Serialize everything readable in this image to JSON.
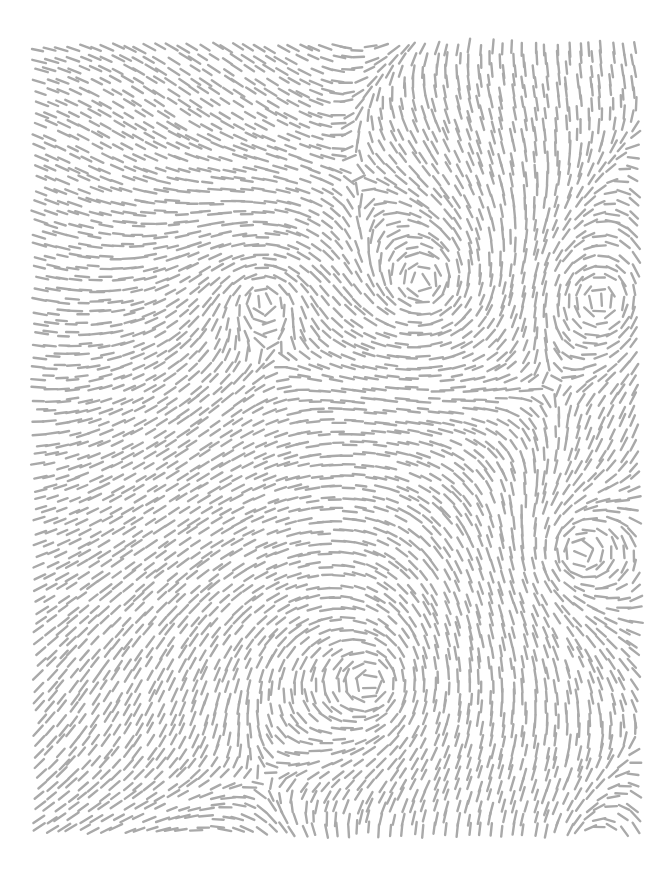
{
  "artwork": {
    "type": "flow-field-dashes",
    "background": "#ffffff",
    "stroke_color": "#a9a9a9",
    "bounds": {
      "left": 36,
      "top": 44,
      "right": 645,
      "bottom": 838
    },
    "vortex_centers": [
      {
        "x": 263,
        "y": 300
      },
      {
        "x": 423,
        "y": 282
      },
      {
        "x": 600,
        "y": 300
      },
      {
        "x": 580,
        "y": 552
      },
      {
        "x": 370,
        "y": 683
      }
    ]
  }
}
